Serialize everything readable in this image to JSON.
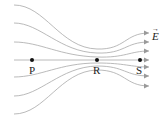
{
  "diagram": {
    "field_label": "E",
    "field_vector_symbol": "→",
    "points": [
      {
        "id": "P",
        "label": "P",
        "x": 32,
        "y": 60
      },
      {
        "id": "R",
        "label": "R",
        "x": 97,
        "y": 60
      },
      {
        "id": "S",
        "label": "S",
        "x": 140,
        "y": 60
      }
    ],
    "line_color": "#9a9a9a",
    "dot_color": "#111111"
  }
}
